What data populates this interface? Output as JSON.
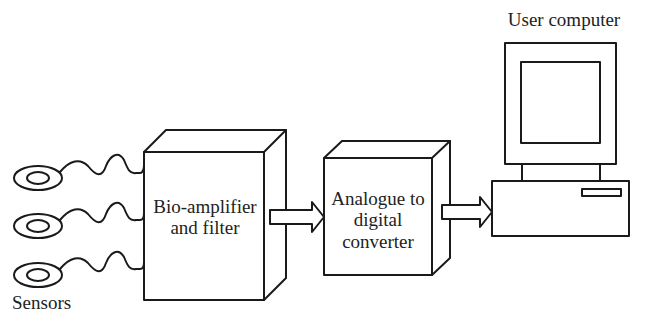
{
  "diagram": {
    "nodes": [
      {
        "id": "sensors",
        "label": "Sensors",
        "shape": "electrode-rings",
        "count": 3
      },
      {
        "id": "bioamp",
        "label_lines": [
          "Bio-amplifier",
          "and filter"
        ],
        "shape": "3d-box"
      },
      {
        "id": "adc",
        "label_lines": [
          "Analogue to",
          "digital",
          "converter"
        ],
        "shape": "3d-box"
      },
      {
        "id": "computer",
        "label": "User computer",
        "shape": "desktop-computer"
      }
    ],
    "edges": [
      {
        "from": "sensors",
        "to": "bioamp",
        "style": "wavy-wires",
        "count": 3
      },
      {
        "from": "bioamp",
        "to": "adc",
        "style": "block-arrow"
      },
      {
        "from": "adc",
        "to": "computer",
        "style": "block-arrow"
      }
    ],
    "colors": {
      "stroke": "#1a1a1a",
      "background": "#ffffff"
    }
  },
  "labels": {
    "sensors": "Sensors",
    "user_computer": "User computer",
    "bioamp_line1": "Bio-amplifier",
    "bioamp_line2": "and filter",
    "adc_line1": "Analogue to",
    "adc_line2": "digital",
    "adc_line3": "converter"
  }
}
